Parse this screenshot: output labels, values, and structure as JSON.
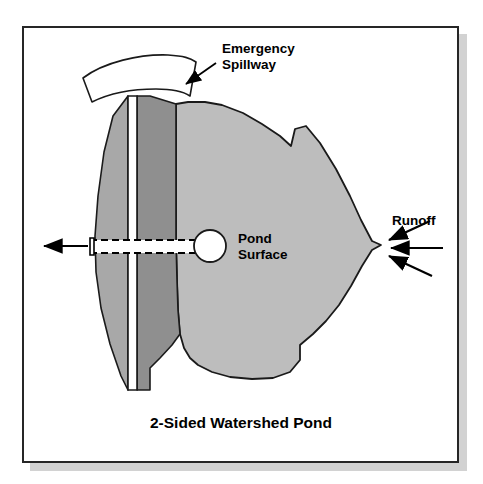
{
  "figure": {
    "title": "2-Sided Watershed Pond",
    "background_color": "#ffffff",
    "frame_border_color": "#262626",
    "shadow_color": "#d2d2d2"
  },
  "labels": {
    "spillway_line1": "Emergency",
    "spillway_line2": "Spillway",
    "pond_line1": "Pond",
    "pond_line2": "Surface",
    "runoff": "Runoff"
  },
  "colors": {
    "pond_fill": "#bdbdbd",
    "embankment_light": "#a8a8a8",
    "embankment_dark": "#8f8f8f",
    "crest_fill": "#ffffff",
    "spillway_fill": "#ffffff",
    "outline": "#1a1a1a",
    "pipe_fill": "#ffffff",
    "riser_fill": "#ffffff"
  },
  "elements": {
    "emergency_spillway": "curved arc band at top of dam",
    "dam_embankment": "two-sided earthen dam with crest",
    "pond_surface": "irregular gray water body",
    "riser_structure": "circle at pond edge",
    "outlet_pipe": "dashed horizontal pipe through dam",
    "outflow_arrow": "arrow pointing left out of pipe",
    "runoff_arrows": "three arrows pointing at pond apex"
  }
}
